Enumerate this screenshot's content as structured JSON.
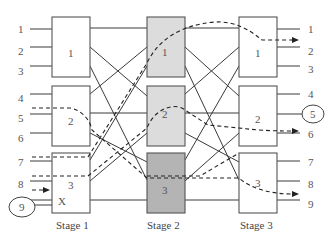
{
  "diagram": {
    "type": "three-stage switching network (Clos network)",
    "stages": [
      {
        "label": "Stage 1",
        "boxes": [
          {
            "label": "1",
            "fill": "#ffffff"
          },
          {
            "label": "2",
            "fill": "#ffffff"
          },
          {
            "label": "3",
            "fill": "#ffffff"
          }
        ]
      },
      {
        "label": "Stage 2",
        "boxes": [
          {
            "label": "1",
            "fill": "#dcdcdc"
          },
          {
            "label": "2",
            "fill": "#dcdcdc"
          },
          {
            "label": "3",
            "fill": "#b4b4b4"
          }
        ]
      },
      {
        "label": "Stage 3",
        "boxes": [
          {
            "label": "1",
            "fill": "#ffffff"
          },
          {
            "label": "2",
            "fill": "#ffffff"
          },
          {
            "label": "3",
            "fill": "#ffffff"
          }
        ]
      }
    ],
    "inputs": [
      "1",
      "2",
      "3",
      "4",
      "5",
      "6",
      "7",
      "8",
      "9"
    ],
    "outputs": [
      "1",
      "2",
      "3",
      "4",
      "5",
      "6",
      "7",
      "8",
      "9"
    ],
    "highlighted_input": "9",
    "highlighted_output": "5",
    "blocked_marker": "X",
    "colors": {
      "line": "#3a3a3a",
      "box_border": "#555555",
      "stage2_light": "#dcdcdc",
      "stage2_dark": "#b4b4b4",
      "text": "#555555"
    }
  }
}
